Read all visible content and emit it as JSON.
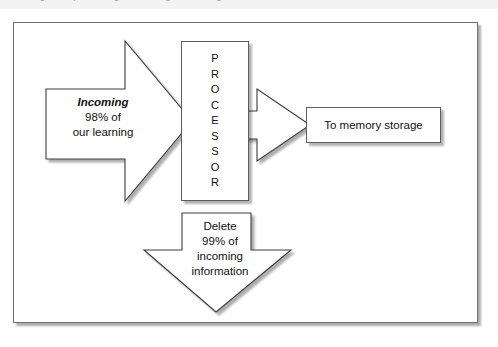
{
  "caption": {
    "text": "Figure — processing and filtering of incoming information"
  },
  "figure": {
    "background_color": "#ffffff",
    "border_color": "#6e6e6e",
    "shadow_color": "#000000"
  },
  "nodes": {
    "processor": {
      "label": "PROCESSOR",
      "letters": [
        "P",
        "R",
        "O",
        "C",
        "E",
        "S",
        "S",
        "O",
        "R"
      ],
      "orientation": "vertical"
    },
    "memory": {
      "label": "To memory storage"
    }
  },
  "arrows": {
    "incoming": {
      "direction": "right",
      "emphasis_line": "Incoming",
      "lines": [
        "98% of",
        "our learning"
      ],
      "percent": "98%"
    },
    "output": {
      "direction": "right",
      "lines": []
    },
    "delete": {
      "direction": "down",
      "lines": [
        "Delete",
        "99% of",
        "incoming",
        "information"
      ],
      "percent": "99%"
    }
  },
  "colors": {
    "stroke": "#3c3c3c",
    "fill": "#ffffff",
    "text": "#111111",
    "shadow": "rgba(0,0,0,0.30)"
  }
}
